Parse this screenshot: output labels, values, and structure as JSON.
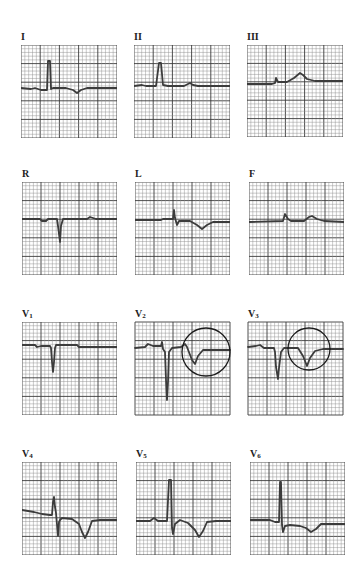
{
  "figure": {
    "type": "12-lead electrocardiogram",
    "grid": {
      "major_divisions": 5,
      "minor_per_major": 5
    },
    "colors": {
      "grid_minor": "#8c8c8c",
      "grid_major": "#3a3a3a",
      "trace": "#3c3c3c",
      "annotation": "#1a1a1a",
      "background": "#ffffff"
    },
    "leads": [
      {
        "id": "I",
        "label": "I",
        "sub": "",
        "x": 21,
        "y": 45,
        "w": 96,
        "h": 93,
        "trace": "0,43 10,44 14,43 20,45 26,45 27,16 29,16 30,44 32,43 45,43 52,45 56,48 60,45 66,43 96,43",
        "circle": null
      },
      {
        "id": "II",
        "label": "II",
        "sub": "",
        "x": 134,
        "y": 45,
        "w": 96,
        "h": 93,
        "trace": "0,41 8,40 12,41 22,41 25,18 27,18 29,40 34,41 50,41 54,39 56,38 59,40 64,41 96,41",
        "circle": null
      },
      {
        "id": "III",
        "label": "III",
        "sub": "",
        "x": 247,
        "y": 45,
        "w": 96,
        "h": 92,
        "trace": "0,39 25,39 28,38 29,33 31,37 40,37 47,33 53,28 56,30 60,34 68,36 96,36",
        "circle": null
      },
      {
        "id": "R",
        "label": "R",
        "sub": "",
        "x": 22,
        "y": 182,
        "w": 95,
        "h": 93,
        "trace": "0,37 18,37 20,39 24,39 26,37 35,37 36,44 38,60 39,44 41,37 65,37 68,35 71,36 74,37 95,37",
        "circle": null
      },
      {
        "id": "L",
        "label": "L",
        "sub": "",
        "x": 135,
        "y": 182,
        "w": 95,
        "h": 93,
        "trace": "0,38 26,38 28,37 38,37 39,28 40,36 42,43 44,39 55,39 62,43 67,47 72,43 78,40 95,40",
        "circle": null
      },
      {
        "id": "F",
        "label": "F",
        "sub": "",
        "x": 249,
        "y": 182,
        "w": 95,
        "h": 93,
        "trace": "0,40 34,39 36,32 39,37 42,39 55,39 60,35 63,34 68,37 75,39 95,40",
        "circle": null
      },
      {
        "id": "V1",
        "label": "V",
        "sub": "1",
        "x": 22,
        "y": 322,
        "w": 95,
        "h": 93,
        "trace": "0,23 13,23 15,25 19,24 28,24 29,26 30,40 31,50 32,40 33,26 34,23 55,23 57,25 95,25",
        "circle": null
      },
      {
        "id": "V2",
        "label": "V",
        "sub": "2",
        "x": 135,
        "y": 322,
        "w": 95,
        "h": 93,
        "trace": "0,26 10,25 13,22 18,24 26,24 27,20 28,27 30,30 31,58 32,78 33,60 34,30 37,26 46,25 50,22 52,25 57,38 60,42 63,34 68,28 95,28",
        "circle": {
          "cx": 71,
          "cy": 30,
          "r": 24
        }
      },
      {
        "id": "V3",
        "label": "V",
        "sub": "3",
        "x": 248,
        "y": 322,
        "w": 95,
        "h": 93,
        "trace": "0,25 8,24 12,23 16,26 26,26 27,30 28,45 30,57 31,46 33,30 36,26 50,26 55,34 59,44 62,36 67,29 75,27 95,27",
        "circle": {
          "cx": 61,
          "cy": 27,
          "r": 21
        }
      },
      {
        "id": "V4",
        "label": "V",
        "sub": "4",
        "x": 22,
        "y": 462,
        "w": 95,
        "h": 93,
        "trace": "0,48 12,50 20,52 28,53 30,53 31,40 32,35 33,45 34,51 36,74 37,60 38,58 40,56 50,57 57,62 60,70 63,76 66,70 70,59 78,58 95,58",
        "circle": null
      },
      {
        "id": "V5",
        "label": "V",
        "sub": "5",
        "x": 136,
        "y": 462,
        "w": 95,
        "h": 93,
        "trace": "0,59 14,59 18,56 22,59 31,59 33,18 35,18 36,66 37,72 39,62 44,58 52,61 59,68 63,75 67,69 71,60 80,59 95,59",
        "circle": null
      },
      {
        "id": "V6",
        "label": "V",
        "sub": "6",
        "x": 250,
        "y": 462,
        "w": 95,
        "h": 93,
        "trace": "0,58 20,58 25,60 29,60 30,20 31,20 32,63 33,70 35,64 40,63 50,64 56,66 61,70 66,67 71,62 80,62 95,62",
        "circle": null
      }
    ]
  }
}
